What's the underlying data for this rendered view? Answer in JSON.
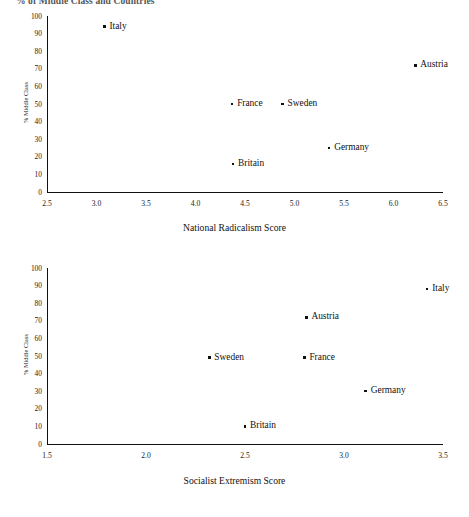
{
  "figure": {
    "title": "% of Middle Class and Countries"
  },
  "chart_data": [
    {
      "type": "scatter",
      "title": "",
      "xlabel": "National Radicalism Score",
      "ylabel": "% Middle Class",
      "xlim": [
        2.5,
        6.5
      ],
      "ylim": [
        0,
        100
      ],
      "xticks": [
        "2.5",
        "3.0",
        "3.5",
        "4.0",
        "4.5",
        "5.0",
        "5.5",
        "6.0",
        "6.5"
      ],
      "yticks": [
        "0",
        "10",
        "20",
        "30",
        "40",
        "50",
        "60",
        "70",
        "80",
        "90",
        "100"
      ],
      "grid": false,
      "legend": "none",
      "points": [
        {
          "label": "Italy",
          "x": 3.08,
          "y": 94
        },
        {
          "label": "Austria",
          "x": 6.22,
          "y": 72
        },
        {
          "label": "France",
          "x": 4.37,
          "y": 50
        },
        {
          "label": "Sweden",
          "x": 4.88,
          "y": 50
        },
        {
          "label": "Germany",
          "x": 5.35,
          "y": 25
        },
        {
          "label": "Britain",
          "x": 4.38,
          "y": 16
        }
      ]
    },
    {
      "type": "scatter",
      "title": "",
      "xlabel": "Socialist Extremism Score",
      "ylabel": "% Middle Class",
      "xlim": [
        1.5,
        3.5
      ],
      "ylim": [
        0,
        100
      ],
      "xticks": [
        "1.5",
        "2.0",
        "2.5",
        "3.0",
        "3.5"
      ],
      "yticks": [
        "0",
        "10",
        "20",
        "30",
        "40",
        "50",
        "60",
        "70",
        "80",
        "90",
        "100"
      ],
      "grid": false,
      "legend": "none",
      "points": [
        {
          "label": "Italy",
          "x": 3.42,
          "y": 88
        },
        {
          "label": "Austria",
          "x": 2.81,
          "y": 72
        },
        {
          "label": "Sweden",
          "x": 2.32,
          "y": 49
        },
        {
          "label": "France",
          "x": 2.8,
          "y": 49
        },
        {
          "label": "Germany",
          "x": 3.11,
          "y": 30
        },
        {
          "label": "Britain",
          "x": 2.5,
          "y": 10
        }
      ]
    }
  ]
}
